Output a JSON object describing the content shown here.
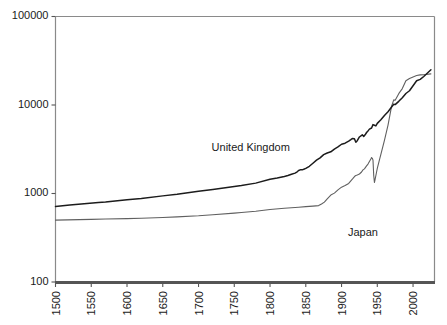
{
  "chart_data": {
    "type": "line",
    "title": "",
    "subtitle": "",
    "xlabel": "",
    "ylabel": "",
    "yscale": "log",
    "xscale": "linear",
    "xlim": [
      1500,
      2030
    ],
    "ylim": [
      100,
      100000
    ],
    "grid": false,
    "legend_position": "inline-annotations",
    "y_tick_labels": [
      "100000",
      "10000",
      "1000",
      "100"
    ],
    "y_tick_values": [
      100000,
      10000,
      1000,
      100
    ],
    "x_tick_labels": [
      "1500",
      "1550",
      "1600",
      "1650",
      "1700",
      "1750",
      "1800",
      "1850",
      "1900",
      "1950",
      "2000"
    ],
    "x_tick_values": [
      1500,
      1550,
      1600,
      1650,
      1700,
      1750,
      1800,
      1850,
      1900,
      1950,
      2000
    ],
    "annotations": [
      {
        "text": "United Kingdom",
        "x": 1773,
        "y": 3000
      },
      {
        "text": "Japan",
        "x": 1930,
        "y": 330
      }
    ],
    "series": [
      {
        "name": "United Kingdom",
        "color": "#1c1c1c",
        "x": [
          1500,
          1520,
          1540,
          1560,
          1570,
          1600,
          1620,
          1650,
          1670,
          1700,
          1720,
          1750,
          1760,
          1780,
          1800,
          1810,
          1820,
          1825,
          1830,
          1835,
          1838,
          1840,
          1843,
          1845,
          1848,
          1850,
          1855,
          1860,
          1865,
          1870,
          1875,
          1880,
          1885,
          1890,
          1895,
          1900,
          1905,
          1910,
          1913,
          1915,
          1918,
          1920,
          1922,
          1925,
          1929,
          1931,
          1933,
          1935,
          1937,
          1939,
          1942,
          1944,
          1946,
          1948,
          1950,
          1955,
          1960,
          1965,
          1970,
          1973,
          1975,
          1980,
          1985,
          1990,
          1995,
          2000,
          2005,
          2010,
          2015,
          2025
        ],
        "y": [
          714,
          740,
          765,
          790,
          800,
          850,
          880,
          940,
          980,
          1060,
          1110,
          1200,
          1230,
          1310,
          1450,
          1500,
          1560,
          1600,
          1650,
          1700,
          1760,
          1820,
          1860,
          1850,
          1890,
          1920,
          2030,
          2200,
          2380,
          2530,
          2750,
          2870,
          2960,
          3180,
          3360,
          3600,
          3700,
          3900,
          4060,
          4180,
          4150,
          3800,
          3950,
          4350,
          4600,
          4420,
          4600,
          4890,
          5100,
          5340,
          5500,
          6000,
          5900,
          5800,
          6200,
          6800,
          7600,
          8400,
          9500,
          10200,
          10100,
          11000,
          12100,
          13500,
          14500,
          16500,
          18800,
          19500,
          21000,
          25000
        ]
      },
      {
        "name": "Japan",
        "color": "#606060",
        "x": [
          1500,
          1550,
          1570,
          1600,
          1620,
          1650,
          1670,
          1700,
          1720,
          1750,
          1760,
          1780,
          1800,
          1820,
          1840,
          1850,
          1860,
          1868,
          1872,
          1876,
          1880,
          1885,
          1890,
          1895,
          1900,
          1905,
          1910,
          1913,
          1916,
          1919,
          1920,
          1922,
          1925,
          1928,
          1930,
          1932,
          1935,
          1937,
          1939,
          1941,
          1942,
          1943,
          1944,
          1945,
          1946,
          1947,
          1949,
          1950,
          1953,
          1955,
          1960,
          1965,
          1970,
          1973,
          1975,
          1980,
          1985,
          1990,
          1995,
          2000,
          2005,
          2010,
          2015,
          2025
        ],
        "y": [
          500,
          510,
          515,
          520,
          525,
          535,
          545,
          560,
          575,
          600,
          610,
          630,
          660,
          680,
          700,
          710,
          720,
          730,
          760,
          800,
          870,
          960,
          1010,
          1100,
          1180,
          1230,
          1300,
          1390,
          1480,
          1580,
          1600,
          1620,
          1660,
          1750,
          1850,
          1900,
          2050,
          2150,
          2300,
          2450,
          2550,
          2500,
          2380,
          1600,
          1330,
          1450,
          1750,
          1920,
          2400,
          2770,
          3980,
          5930,
          9700,
          11430,
          11340,
          13430,
          15330,
          18790,
          19900,
          20740,
          21500,
          21900,
          22000,
          22500
        ]
      }
    ]
  },
  "axes": {
    "y_axis_name": "y-axis-log-scale",
    "x_axis_name": "x-axis-years"
  }
}
